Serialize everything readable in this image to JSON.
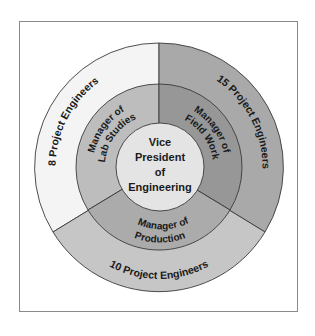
{
  "diagram": {
    "type": "concentric-org-chart",
    "center": {
      "lines": [
        "Vice",
        "President",
        "of",
        "Engineering"
      ],
      "color": "#e4e4e4"
    },
    "middle_ring": [
      {
        "label_lines": [
          "Manager of",
          "Lab Studies"
        ],
        "color": "#bdbdbd"
      },
      {
        "label_lines": [
          "Manager of",
          "Field Work"
        ],
        "color": "#979797"
      },
      {
        "label_lines": [
          "Manager of",
          "Production"
        ],
        "color": "#ababab"
      }
    ],
    "outer_ring": [
      {
        "label": "8 Project Engineers",
        "color": "#f4f4f4"
      },
      {
        "label": "15 Project Engineers",
        "color": "#a9a9a9"
      },
      {
        "label": "10 Project Engineers",
        "color": "#c6c6c6"
      }
    ],
    "stroke_color": "#3a3a3a"
  }
}
